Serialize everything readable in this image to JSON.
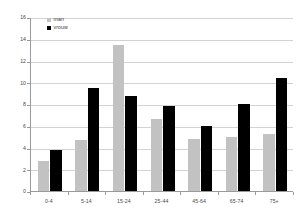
{
  "chart_data": {
    "type": "bar",
    "title": "",
    "subtitle": "",
    "xlabel": "",
    "ylabel": "",
    "categories": [
      "0-4",
      "5-14",
      "15-24",
      "25-44",
      "45-64",
      "65-74",
      "75+"
    ],
    "series": [
      {
        "name": "man",
        "color": "#c2c2c2",
        "values": [
          2.8,
          4.7,
          13.4,
          6.6,
          4.8,
          5.0,
          5.2
        ]
      },
      {
        "name": "vrouw",
        "color": "#000000",
        "values": [
          3.8,
          9.5,
          8.7,
          7.8,
          6.0,
          8.0,
          10.4
        ]
      }
    ],
    "ylim": [
      0,
      16
    ],
    "ytick_step": 2,
    "yticks": [
      "0",
      "2",
      "4",
      "6",
      "8",
      "10",
      "12",
      "14",
      "16"
    ],
    "grid": true,
    "grid_axis": "y",
    "legend_position": "top-left",
    "axis_color": "#9a9a9a",
    "grid_color": "#d3d3d3",
    "background": "#ffffff"
  }
}
